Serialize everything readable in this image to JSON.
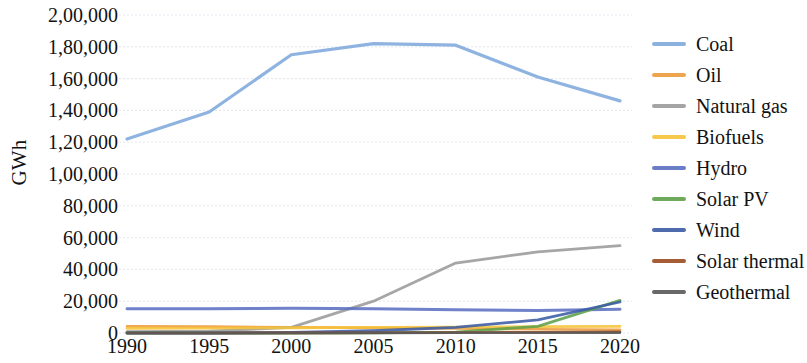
{
  "chart_data": {
    "type": "line",
    "title": "",
    "xlabel": "",
    "ylabel": "GWh",
    "x": [
      1990,
      1995,
      2000,
      2005,
      2010,
      2015,
      2020
    ],
    "categories": [
      "1990",
      "1995",
      "2000",
      "2005",
      "2010",
      "2015",
      "2020"
    ],
    "xlim": [
      1990,
      2020
    ],
    "ylim": [
      0,
      200000
    ],
    "ytick_values": [
      0,
      20000,
      40000,
      60000,
      80000,
      100000,
      120000,
      140000,
      160000,
      180000,
      200000
    ],
    "ytick_labels": [
      "0",
      "20,000",
      "40,000",
      "60,000",
      "80,000",
      "1,00,000",
      "1,20,000",
      "1,40,000",
      "1,60,000",
      "1,80,000",
      "2,00,000"
    ],
    "grid": true,
    "legend_position": "right",
    "series": [
      {
        "name": "Coal",
        "color": "#7FA9DC",
        "width": 3.2,
        "values": [
          122000,
          139000,
          175000,
          182000,
          181000,
          161000,
          146000
        ]
      },
      {
        "name": "Oil",
        "color": "#ED9A3B",
        "width": 2.6,
        "values": [
          4200,
          4000,
          3600,
          3200,
          2800,
          2400,
          2000
        ]
      },
      {
        "name": "Natural gas",
        "color": "#9A9A9A",
        "width": 2.8,
        "values": [
          800,
          1200,
          3500,
          20000,
          44000,
          51000,
          55000
        ]
      },
      {
        "name": "Biofuels",
        "color": "#F5C33B",
        "width": 2.8,
        "values": [
          3000,
          3100,
          3300,
          3500,
          3700,
          4000,
          4200
        ]
      },
      {
        "name": "Hydro",
        "color": "#5B6FC0",
        "width": 3.0,
        "values": [
          15200,
          15300,
          15500,
          15200,
          14600,
          14200,
          15000
        ]
      },
      {
        "name": "Solar PV",
        "color": "#5FA14A",
        "width": 2.8,
        "values": [
          0,
          0,
          0,
          100,
          600,
          4200,
          20500
        ]
      },
      {
        "name": "Wind",
        "color": "#3B5BA5",
        "width": 2.8,
        "values": [
          0,
          0,
          300,
          1400,
          3600,
          8200,
          19500
        ]
      },
      {
        "name": "Solar thermal",
        "color": "#9C4A1E",
        "width": 2.6,
        "values": [
          0,
          0,
          100,
          200,
          300,
          500,
          700
        ]
      },
      {
        "name": "Geothermal",
        "color": "#595959",
        "width": 2.6,
        "values": [
          0,
          0,
          0,
          100,
          150,
          200,
          250
        ]
      }
    ]
  }
}
